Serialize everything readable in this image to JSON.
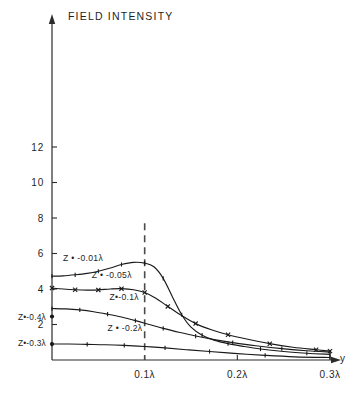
{
  "chart_data": {
    "type": "line",
    "title": "FIELD INTENSITY",
    "xlabel": "y",
    "ylabel": "",
    "xlim": [
      0,
      0.33
    ],
    "ylim": [
      0,
      13.6
    ],
    "grid": false,
    "legend": "inline-curve-labels",
    "x_ticks": [
      {
        "value": 0.1,
        "label": "0.1λ"
      },
      {
        "value": 0.2,
        "label": "0.2λ"
      },
      {
        "value": 0.3,
        "label": "0.3λ"
      }
    ],
    "y_ticks": [
      {
        "value": 12,
        "label": "12"
      },
      {
        "value": 10,
        "label": "10"
      },
      {
        "value": 8,
        "label": "8"
      },
      {
        "value": 6,
        "label": "6"
      },
      {
        "value": 4,
        "label": "4"
      },
      {
        "value": 2,
        "label": "2"
      }
    ],
    "annotations": [
      {
        "name": "dashed-reference-line",
        "type": "vline",
        "x": 0.1,
        "style": "dashed",
        "color": "#4a4a4a"
      }
    ],
    "axis_labels": [
      {
        "name": "y-axis-label",
        "text": "Z•-0.4λ",
        "x": 0.0,
        "y": 2.45,
        "side": "left"
      },
      {
        "name": "y-axis-label",
        "text": "Z•-0.3λ",
        "x": 0.0,
        "y": 0.95,
        "side": "left"
      }
    ],
    "series": [
      {
        "name": "Z = -0.01λ",
        "label": "Z • -0.01λ",
        "label_x": 0.012,
        "label_y": 5.55,
        "marker": "plus",
        "points": [
          [
            0.0,
            4.72
          ],
          [
            0.012,
            4.74
          ],
          [
            0.025,
            4.8
          ],
          [
            0.038,
            4.88
          ],
          [
            0.05,
            5.0
          ],
          [
            0.063,
            5.18
          ],
          [
            0.075,
            5.38
          ],
          [
            0.088,
            5.5
          ],
          [
            0.1,
            5.46
          ],
          [
            0.11,
            5.25
          ],
          [
            0.12,
            4.6
          ],
          [
            0.13,
            3.55
          ],
          [
            0.14,
            2.55
          ],
          [
            0.15,
            1.85
          ],
          [
            0.162,
            1.4
          ],
          [
            0.175,
            1.12
          ],
          [
            0.19,
            0.92
          ],
          [
            0.205,
            0.78
          ],
          [
            0.225,
            0.62
          ],
          [
            0.25,
            0.48
          ],
          [
            0.275,
            0.38
          ],
          [
            0.3,
            0.32
          ]
        ]
      },
      {
        "name": "Z = -0.05λ",
        "label": "Z • -0.05λ",
        "label_x": 0.043,
        "label_y": 4.62,
        "marker": "cross",
        "points": [
          [
            0.0,
            4.05
          ],
          [
            0.012,
            4.0
          ],
          [
            0.025,
            3.96
          ],
          [
            0.038,
            3.94
          ],
          [
            0.05,
            3.95
          ],
          [
            0.063,
            4.0
          ],
          [
            0.075,
            4.02
          ],
          [
            0.088,
            3.96
          ],
          [
            0.1,
            3.8
          ],
          [
            0.112,
            3.48
          ],
          [
            0.125,
            3.02
          ],
          [
            0.14,
            2.5
          ],
          [
            0.155,
            2.05
          ],
          [
            0.172,
            1.7
          ],
          [
            0.19,
            1.42
          ],
          [
            0.21,
            1.18
          ],
          [
            0.235,
            0.92
          ],
          [
            0.26,
            0.72
          ],
          [
            0.285,
            0.58
          ],
          [
            0.3,
            0.5
          ]
        ]
      },
      {
        "name": "Z = -0.1λ",
        "label": "Z•-0.1λ",
        "label_x": 0.062,
        "label_y": 3.4,
        "marker": "plus",
        "points": [
          [
            0.0,
            2.9
          ],
          [
            0.015,
            2.88
          ],
          [
            0.03,
            2.82
          ],
          [
            0.045,
            2.72
          ],
          [
            0.06,
            2.58
          ],
          [
            0.075,
            2.42
          ],
          [
            0.09,
            2.22
          ],
          [
            0.105,
            2.0
          ],
          [
            0.12,
            1.78
          ],
          [
            0.138,
            1.55
          ],
          [
            0.155,
            1.35
          ],
          [
            0.175,
            1.15
          ],
          [
            0.195,
            0.98
          ],
          [
            0.22,
            0.8
          ],
          [
            0.248,
            0.64
          ],
          [
            0.275,
            0.52
          ],
          [
            0.3,
            0.45
          ]
        ]
      },
      {
        "name": "Z = -0.2λ",
        "label": "Z • -0.2λ",
        "label_x": 0.06,
        "label_y": 1.62,
        "marker": "plus",
        "points": [
          [
            0.0,
            0.9
          ],
          [
            0.018,
            0.9
          ],
          [
            0.038,
            0.88
          ],
          [
            0.058,
            0.86
          ],
          [
            0.078,
            0.82
          ],
          [
            0.1,
            0.76
          ],
          [
            0.122,
            0.68
          ],
          [
            0.145,
            0.58
          ],
          [
            0.17,
            0.48
          ],
          [
            0.2,
            0.36
          ],
          [
            0.23,
            0.26
          ],
          [
            0.262,
            0.18
          ],
          [
            0.3,
            0.14
          ]
        ]
      }
    ],
    "edge_markers": [
      {
        "name": "axis-dot",
        "x": 0.0,
        "y": 2.45
      },
      {
        "name": "axis-dot",
        "x": 0.0,
        "y": 0.9
      }
    ]
  }
}
